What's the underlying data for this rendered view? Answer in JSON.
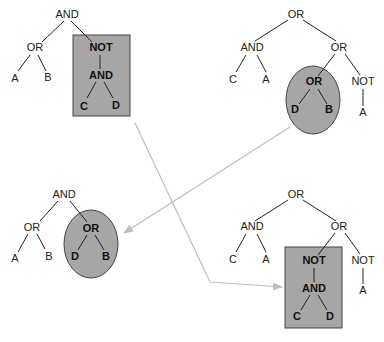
{
  "diagram": {
    "colors": {
      "highlight_fill": "#a6a6a6",
      "highlight_stroke": "#444444",
      "arrow": "#bdbdbd",
      "text": "#222222"
    },
    "parent1": {
      "nodes": [
        "AND",
        "OR",
        "A",
        "B",
        "NOT",
        "AND",
        "C",
        "D"
      ],
      "highlight_shape": "rectangle",
      "highlighted_subtree": "NOT(AND(C, D))"
    },
    "parent2": {
      "nodes": [
        "OR",
        "AND",
        "C",
        "A",
        "OR",
        "OR",
        "D",
        "B",
        "NOT",
        "A"
      ],
      "highlight_shape": "ellipse",
      "highlighted_subtree": "OR(D, B)"
    },
    "offspring1": {
      "nodes": [
        "AND",
        "OR",
        "A",
        "B",
        "OR",
        "D",
        "B"
      ],
      "highlight_shape": "ellipse"
    },
    "offspring2": {
      "nodes": [
        "OR",
        "AND",
        "C",
        "A",
        "OR",
        "NOT",
        "AND",
        "C",
        "D",
        "NOT",
        "A"
      ],
      "highlight_shape": "rectangle"
    },
    "arrows": [
      {
        "from": "parent1-subtree",
        "to": "offspring2-subtree"
      },
      {
        "from": "parent2-subtree",
        "to": "offspring1-subtree"
      }
    ]
  }
}
